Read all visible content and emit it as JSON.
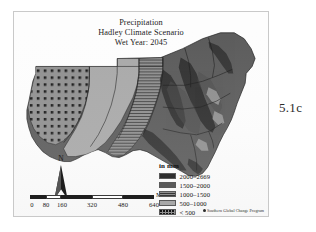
{
  "figure": {
    "label": "5.1c"
  },
  "map": {
    "title_lines": [
      "Precipitation",
      "Hadley Climate Scenario",
      "Wet Year: 2045"
    ],
    "credit": "Southern Global Change Program",
    "credit_mark_icon": "logo-mark-icon"
  },
  "north_arrow": {
    "letter": "N",
    "icon": "north-arrow-icon"
  },
  "scale_bar": {
    "unit_label": "Miles",
    "ticks": [
      "0",
      "80",
      "160",
      "320",
      "480",
      "640"
    ],
    "tick_values": [
      0,
      80,
      160,
      320,
      480,
      640
    ],
    "max_miles": 640
  },
  "legend": {
    "title": "in mm",
    "entries": [
      {
        "label": "2000–2669",
        "swatch": "fill-c1",
        "color": "#2e2e2e",
        "min": 2000,
        "max": 2669
      },
      {
        "label": "1500–2000",
        "swatch": "fill-c2",
        "color": "#5a5a5a",
        "min": 1500,
        "max": 2000
      },
      {
        "label": "1000–1500",
        "swatch": "fill-c3",
        "color": "#8e8e8e",
        "min": 1000,
        "max": 1500
      },
      {
        "label": "500–1000",
        "swatch": "fill-c4",
        "color": "#a8a8a8",
        "min": 500,
        "max": 1000
      },
      {
        "label": "< 500",
        "swatch": "fill-c5",
        "color": "#8f8f8f",
        "min": 0,
        "max": 500
      }
    ]
  }
}
